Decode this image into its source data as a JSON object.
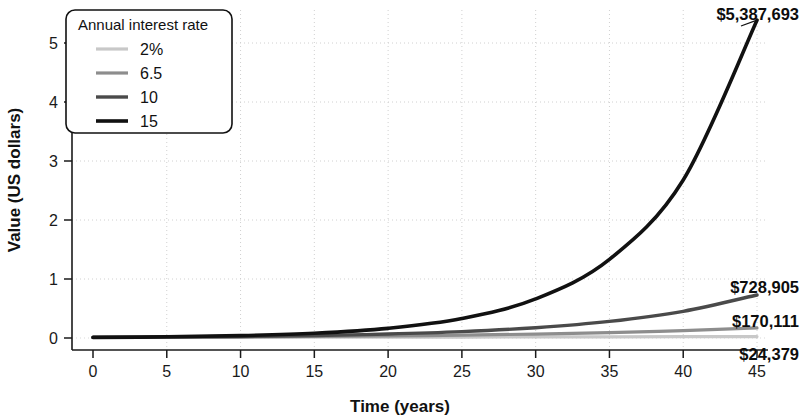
{
  "chart_data": {
    "type": "line",
    "title": "",
    "subtitle": "",
    "xlabel": "Time (years)",
    "ylabel": "Value (US dollars)",
    "xlim": [
      0,
      46
    ],
    "ylim": [
      -0.25,
      5.6
    ],
    "xticks": [
      0,
      5,
      10,
      15,
      20,
      25,
      30,
      35,
      40,
      45
    ],
    "xtick_labels": [
      "0",
      "5",
      "10",
      "15",
      "20",
      "25",
      "30",
      "35",
      "40",
      "45"
    ],
    "yticks": [
      0,
      1,
      2,
      3,
      4,
      5
    ],
    "ytick_labels": [
      "0",
      "1",
      "2",
      "3",
      "4",
      "5"
    ],
    "y_units": "millions of US dollars",
    "grid": true,
    "grid_style": "dotted",
    "legend_position": "upper-left",
    "legend_title": "Annual interest rate",
    "x": [
      0,
      5,
      10,
      15,
      20,
      25,
      30,
      35,
      40,
      45
    ],
    "series": [
      {
        "name": "2%",
        "color": "#c8c8c8",
        "width": 3.2,
        "values": [
          0.01,
          0.011,
          0.0122,
          0.0135,
          0.0149,
          0.0164,
          0.0181,
          0.02,
          0.0221,
          0.0244
        ],
        "end_label": "$24,379"
      },
      {
        "name": "6.5",
        "color": "#8d8d8d",
        "width": 3.2,
        "values": [
          0.01,
          0.0137,
          0.0188,
          0.0257,
          0.0352,
          0.0483,
          0.0662,
          0.0907,
          0.1243,
          0.1701
        ],
        "end_label": "$170,111"
      },
      {
        "name": "10",
        "color": "#4a4a4a",
        "width": 3.4,
        "values": [
          0.01,
          0.0161,
          0.0259,
          0.0418,
          0.0673,
          0.1083,
          0.1745,
          0.281,
          0.4526,
          0.7289
        ],
        "end_label": "$728,905"
      },
      {
        "name": "15",
        "color": "#111111",
        "width": 3.6,
        "values": [
          0.01,
          0.0201,
          0.0405,
          0.0814,
          0.1637,
          0.3292,
          0.6621,
          1.3318,
          2.6786,
          5.3877
        ],
        "end_label": "$5,387,693"
      }
    ],
    "annotations": [
      {
        "text": "$5,387,693",
        "series": "15",
        "value": 5.3877
      },
      {
        "text": "$728,905",
        "series": "10",
        "value": 0.7289
      },
      {
        "text": "$170,111",
        "series": "6.5",
        "value": 0.1701
      },
      {
        "text": "$24,379",
        "series": "2%",
        "value": 0.0244
      }
    ]
  },
  "legend": {
    "title": "Annual interest rate",
    "items": [
      {
        "label": "2%"
      },
      {
        "label": "6.5"
      },
      {
        "label": "10"
      },
      {
        "label": "15"
      }
    ]
  },
  "axes": {
    "x_title": "Time (years)",
    "y_title": "Value (US dollars)"
  }
}
